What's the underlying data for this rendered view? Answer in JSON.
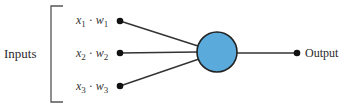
{
  "diagram": {
    "type": "perceptron",
    "inputs_label": "Inputs",
    "output_label": "Output",
    "inputs": [
      {
        "x": "x",
        "x_sub": "1",
        "dot": "·",
        "w": "w",
        "w_sub": "1"
      },
      {
        "x": "x",
        "x_sub": "2",
        "dot": "·",
        "w": "w",
        "w_sub": "2"
      },
      {
        "x": "x",
        "x_sub": "3",
        "dot": "·",
        "w": "w",
        "w_sub": "3"
      }
    ],
    "colors": {
      "neuron_fill": "#5aabdc",
      "stroke": "#222222"
    }
  }
}
